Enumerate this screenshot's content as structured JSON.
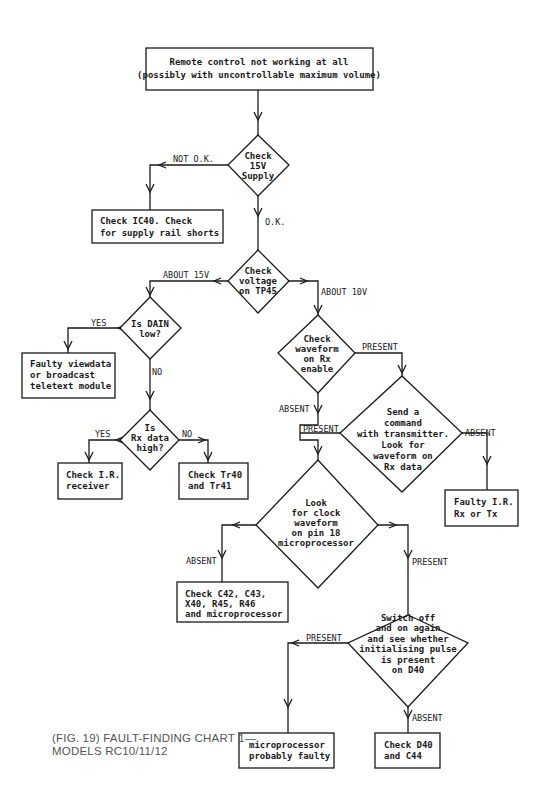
{
  "caption": {
    "line1": "(FIG. 19) FAULT-FINDING CHART 1—",
    "line2": "MODELS RC10/11/12"
  },
  "nodes": {
    "start": {
      "type": "box",
      "lines": [
        "Remote control not working at all",
        "(possibly with uncontrollable maximum volume)"
      ]
    },
    "check_15v": {
      "type": "decision",
      "lines": [
        "Check",
        "15V",
        "Supply"
      ]
    },
    "check_ic40": {
      "type": "box",
      "lines": [
        "Check IC40.  Check",
        "for supply rail shorts"
      ]
    },
    "check_tp45": {
      "type": "decision",
      "lines": [
        "Check",
        "voltage",
        "on TP45"
      ]
    },
    "dain_low": {
      "type": "decision",
      "lines": [
        "Is DAIN",
        "low?"
      ]
    },
    "faulty_viewdata": {
      "type": "box",
      "lines": [
        "Faulty viewdata",
        "or broadcast",
        "teletext module"
      ]
    },
    "rx_data_high": {
      "type": "decision",
      "lines": [
        "Is",
        "Rx data",
        "high?"
      ]
    },
    "check_ir_receiver": {
      "type": "box",
      "lines": [
        "Check I.R.",
        "receiver"
      ]
    },
    "check_tr40": {
      "type": "box",
      "lines": [
        "Check Tr40",
        "and Tr41"
      ]
    },
    "check_rx_enable": {
      "type": "decision",
      "lines": [
        "Check",
        "waveform",
        "on Rx",
        "enable"
      ]
    },
    "send_command": {
      "type": "decision",
      "lines": [
        "Send a",
        "command",
        "with transmitter.",
        "Look for",
        "waveform on",
        "Rx data"
      ]
    },
    "faulty_ir": {
      "type": "box",
      "lines": [
        "Faulty I.R.",
        "Rx or Tx"
      ]
    },
    "clock_waveform": {
      "type": "decision",
      "lines": [
        "Look",
        "for clock",
        "waveform",
        "on pin 18",
        "microprocessor"
      ]
    },
    "check_c42": {
      "type": "box",
      "lines": [
        "Check C42, C43,",
        "X40, R45, R46",
        "and microprocessor"
      ]
    },
    "switch_off_on": {
      "type": "decision",
      "lines": [
        "Switch off",
        "and on again",
        "and see whether",
        "initialising pulse",
        "is present",
        "on D40"
      ]
    },
    "micro_faulty": {
      "type": "box",
      "lines": [
        "microprocessor",
        "probably faulty"
      ]
    },
    "check_d40": {
      "type": "box",
      "lines": [
        "Check D40",
        "and C44"
      ]
    }
  },
  "edge_labels": {
    "not_ok": "NOT O.K.",
    "ok": "O.K.",
    "about_15v": "ABOUT 15V",
    "about_10v": "ABOUT 10V",
    "yes_dain": "YES",
    "no_dain": "NO",
    "yes_rx": "YES",
    "no_rx": "NO",
    "present_rx_enable": "PRESENT",
    "absent_rx_enable": "ABSENT",
    "present_send": "PRESENT",
    "absent_send": "ABSENT",
    "absent_clock": "ABSENT",
    "present_clock": "PRESENT",
    "present_init": "PRESENT",
    "absent_init": "ABSENT"
  }
}
